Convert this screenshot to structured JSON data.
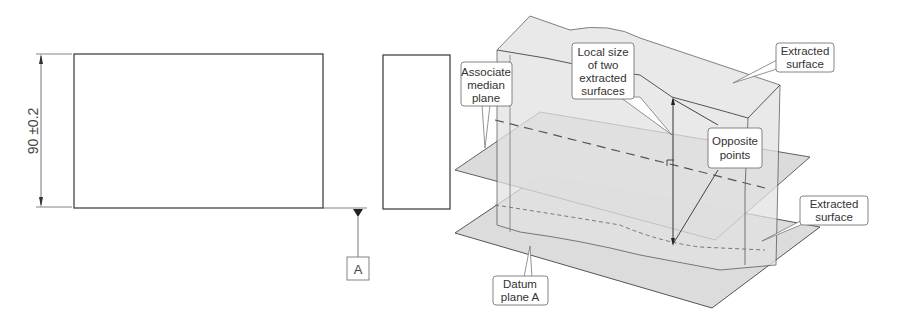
{
  "drawing": {
    "front_view": {
      "dimension_label": "90 ±0.2",
      "datum_label": "A"
    },
    "isometric_view": {
      "callouts": {
        "associate_median_plane": [
          "Associate",
          "median",
          "plane"
        ],
        "local_size": [
          "Local size",
          "of two",
          "extracted",
          "surfaces"
        ],
        "extracted_surface_top": [
          "Extracted",
          "surface"
        ],
        "opposite_points": [
          "Opposite",
          "points"
        ],
        "extracted_surface_bottom": [
          "Extracted",
          "surface"
        ],
        "datum_plane": [
          "Datum",
          "plane A"
        ]
      }
    }
  },
  "colors": {
    "line": "#444444",
    "surface_fill": "#d9d9d9",
    "surface_fill_light": "#e6e6e6",
    "callout_border": "#777777"
  }
}
